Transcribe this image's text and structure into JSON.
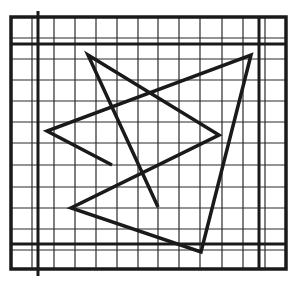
{
  "figure": {
    "colors": {
      "background": "#ffffff",
      "grid_line": "#2a2a2a",
      "border_line": "#1a1a1a",
      "shape_stroke": "#1a1a1a"
    },
    "frame": {
      "left": 11,
      "top": 17,
      "right": 286,
      "bottom": 269
    },
    "grid": {
      "vertical_lines_x": [
        32,
        54,
        75,
        96,
        117,
        138,
        158,
        179,
        200,
        222,
        243,
        265
      ],
      "horizontal_lines_y": [
        38,
        59,
        80,
        101,
        122,
        143,
        165,
        187,
        208,
        229,
        250
      ]
    },
    "thick_lines": {
      "vertical": [
        {
          "x": 38,
          "y1": 11,
          "y2": 276
        },
        {
          "x": 259,
          "y1": 17,
          "y2": 269
        }
      ],
      "horizontal": [
        {
          "y": 44,
          "x1": 11,
          "x2": 286
        },
        {
          "y": 244,
          "x1": 11,
          "x2": 286
        }
      ]
    },
    "polyline_points": [
      [
        112,
        165
      ],
      [
        47,
        131
      ],
      [
        251,
        55
      ],
      [
        201,
        252
      ],
      [
        71,
        208
      ],
      [
        219,
        135
      ],
      [
        88,
        55
      ],
      [
        158,
        207
      ]
    ],
    "label": "Grid figure with intersecting polyline"
  }
}
